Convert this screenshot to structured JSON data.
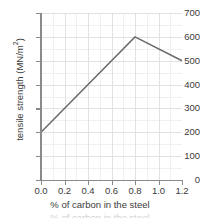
{
  "chart_data": {
    "type": "line",
    "title": "",
    "xlabel": "% of carbon in the steel",
    "ylabel": "tensile strength (MN/m",
    "ylabel_sup": "2",
    "ylabel_suffix": ")",
    "ylabel_full": "tensile strength (MN/m²)",
    "x": [
      0.0,
      0.8,
      1.2
    ],
    "values": [
      200,
      600,
      500
    ],
    "series": [
      {
        "name": "tensile strength",
        "points": [
          {
            "x": 0.0,
            "y": 200
          },
          {
            "x": 0.8,
            "y": 600
          },
          {
            "x": 1.2,
            "y": 500
          }
        ]
      }
    ],
    "xlim": [
      0.0,
      1.2
    ],
    "ylim": [
      0,
      700
    ],
    "xticks": [
      "0.0",
      "0.2",
      "0.4",
      "0.6",
      "0.8",
      "1.0",
      "1.2"
    ],
    "xtick_values": [
      0.0,
      0.2,
      0.4,
      0.6,
      0.8,
      1.0,
      1.2
    ],
    "yticks": [
      "0",
      "100",
      "200",
      "300",
      "400",
      "500",
      "600",
      "700"
    ],
    "ytick_values": [
      0,
      100,
      200,
      300,
      400,
      500,
      600,
      700
    ],
    "grid": true,
    "grid_minor": true,
    "legend": false,
    "line_color": "#6a6a6a",
    "axis_color": "#8a8a8a",
    "grid_color": "#e2e2e2",
    "grid_minor_color": "#f0f0f0",
    "text_color": "#3b3b3b",
    "background": "#ffffff"
  },
  "caption": {
    "cropped_text": "% of carbon in the steel"
  }
}
